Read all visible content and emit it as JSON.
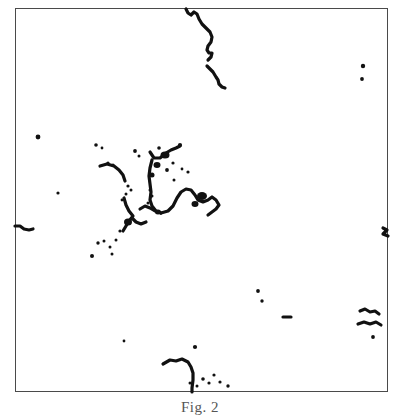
{
  "figure": {
    "caption": "Fig. 2",
    "frame": {
      "x": 15,
      "y": 8,
      "width": 373,
      "height": 384,
      "border_color": "#4a4a4a",
      "border_width": 1.4
    },
    "background_color": "#ffffff",
    "ink_color": "#111111"
  },
  "chart_data": {
    "type": "scatter",
    "title": "Fig. 2",
    "subtitle": "",
    "xlabel": "",
    "ylabel": "",
    "xlim": [
      0,
      400
    ],
    "ylim": [
      0,
      415
    ],
    "grid": false,
    "legend": null,
    "axis_ticks": {
      "x": [],
      "y": []
    },
    "series": [
      {
        "name": "isolated-dots",
        "marker": "dot",
        "points": [
          {
            "x": 38,
            "y": 137,
            "r": 2.4
          },
          {
            "x": 58,
            "y": 193,
            "r": 1.6
          },
          {
            "x": 96,
            "y": 145,
            "r": 1.8
          },
          {
            "x": 102,
            "y": 148,
            "r": 1.4
          },
          {
            "x": 108,
            "y": 163,
            "r": 1.6
          },
          {
            "x": 113,
            "y": 165,
            "r": 1.5
          },
          {
            "x": 135,
            "y": 151,
            "r": 1.9
          },
          {
            "x": 139,
            "y": 156,
            "r": 1.5
          },
          {
            "x": 159,
            "y": 148,
            "r": 1.8
          },
          {
            "x": 167,
            "y": 170,
            "r": 1.9
          },
          {
            "x": 173,
            "y": 163,
            "r": 1.6
          },
          {
            "x": 174,
            "y": 180,
            "r": 1.5
          },
          {
            "x": 180,
            "y": 145,
            "r": 2.1
          },
          {
            "x": 188,
            "y": 172,
            "r": 1.6
          },
          {
            "x": 182,
            "y": 169,
            "r": 1.4
          },
          {
            "x": 128,
            "y": 186,
            "r": 1.6
          },
          {
            "x": 131,
            "y": 190,
            "r": 1.5
          },
          {
            "x": 126,
            "y": 194,
            "r": 1.5
          },
          {
            "x": 150,
            "y": 190,
            "r": 1.5
          },
          {
            "x": 152,
            "y": 196,
            "r": 1.5
          },
          {
            "x": 148,
            "y": 203,
            "r": 1.5
          },
          {
            "x": 122,
            "y": 200,
            "r": 1.4
          },
          {
            "x": 98,
            "y": 243,
            "r": 1.7
          },
          {
            "x": 104,
            "y": 241,
            "r": 1.5
          },
          {
            "x": 110,
            "y": 247,
            "r": 1.5
          },
          {
            "x": 116,
            "y": 240,
            "r": 1.5
          },
          {
            "x": 112,
            "y": 254,
            "r": 1.5
          },
          {
            "x": 92,
            "y": 256,
            "r": 2.0
          },
          {
            "x": 120,
            "y": 231,
            "r": 1.6
          },
          {
            "x": 258,
            "y": 291,
            "r": 1.9
          },
          {
            "x": 262,
            "y": 301,
            "r": 1.7
          },
          {
            "x": 363,
            "y": 66,
            "r": 2.2
          },
          {
            "x": 362,
            "y": 79,
            "r": 1.9
          },
          {
            "x": 373,
            "y": 337,
            "r": 1.9
          },
          {
            "x": 124,
            "y": 341,
            "r": 1.4
          },
          {
            "x": 195,
            "y": 347,
            "r": 2.1
          },
          {
            "x": 203,
            "y": 379,
            "r": 1.8
          },
          {
            "x": 209,
            "y": 383,
            "r": 1.6
          },
          {
            "x": 214,
            "y": 375,
            "r": 1.6
          },
          {
            "x": 220,
            "y": 382,
            "r": 1.6
          },
          {
            "x": 228,
            "y": 386,
            "r": 1.7
          },
          {
            "x": 197,
            "y": 386,
            "r": 1.5
          },
          {
            "x": 190,
            "y": 383,
            "r": 1.5
          }
        ]
      },
      {
        "name": "heavy-blobs",
        "marker": "blob",
        "points": [
          {
            "x": 165,
            "y": 155,
            "w": 9,
            "h": 7
          },
          {
            "x": 157,
            "y": 165,
            "w": 7,
            "h": 6
          },
          {
            "x": 152,
            "y": 175,
            "w": 5,
            "h": 5
          },
          {
            "x": 202,
            "y": 196,
            "w": 10,
            "h": 8
          },
          {
            "x": 195,
            "y": 204,
            "w": 7,
            "h": 6
          },
          {
            "x": 128,
            "y": 222,
            "w": 8,
            "h": 7
          },
          {
            "x": 158,
            "y": 212,
            "w": 6,
            "h": 5
          }
        ]
      }
    ],
    "polylines": [
      {
        "name": "top-wavy-strand",
        "points": [
          [
            186,
            9
          ],
          [
            188,
            13
          ],
          [
            191,
            15
          ],
          [
            194,
            12
          ],
          [
            197,
            14
          ],
          [
            199,
            19
          ],
          [
            202,
            24
          ],
          [
            206,
            28
          ],
          [
            210,
            32
          ],
          [
            212,
            37
          ],
          [
            211,
            42
          ],
          [
            208,
            46
          ],
          [
            207,
            50
          ],
          [
            209,
            53
          ],
          [
            212,
            53
          ],
          [
            211,
            57
          ],
          [
            208,
            60
          ]
        ]
      },
      {
        "name": "top-wavy-strand-lower",
        "points": [
          [
            207,
            66
          ],
          [
            210,
            69
          ],
          [
            213,
            72
          ],
          [
            216,
            77
          ],
          [
            218,
            80
          ],
          [
            219,
            84
          ],
          [
            222,
            87
          ],
          [
            225,
            88
          ]
        ]
      },
      {
        "name": "central-arc-left",
        "points": [
          [
            100,
            166
          ],
          [
            107,
            164
          ],
          [
            114,
            166
          ],
          [
            119,
            170
          ],
          [
            123,
            175
          ],
          [
            125,
            181
          ]
        ]
      },
      {
        "name": "central-arc-lower-left",
        "points": [
          [
            124,
            198
          ],
          [
            126,
            205
          ],
          [
            129,
            211
          ],
          [
            133,
            216
          ],
          [
            129,
            221
          ],
          [
            126,
            226
          ],
          [
            123,
            231
          ]
        ]
      },
      {
        "name": "central-spine",
        "points": [
          [
            150,
            152
          ],
          [
            154,
            158
          ],
          [
            160,
            158
          ],
          [
            166,
            153
          ],
          [
            171,
            150
          ],
          [
            176,
            148
          ],
          [
            180,
            146
          ]
        ]
      },
      {
        "name": "central-vertical",
        "points": [
          [
            152,
            160
          ],
          [
            150,
            168
          ],
          [
            149,
            176
          ],
          [
            150,
            184
          ],
          [
            151,
            192
          ],
          [
            150,
            200
          ],
          [
            152,
            206
          ],
          [
            156,
            211
          ],
          [
            161,
            213
          ]
        ]
      },
      {
        "name": "central-arch-right",
        "points": [
          [
            161,
            213
          ],
          [
            168,
            211
          ],
          [
            173,
            206
          ],
          [
            177,
            198
          ],
          [
            181,
            192
          ],
          [
            186,
            189
          ],
          [
            191,
            190
          ],
          [
            195,
            195
          ],
          [
            198,
            200
          ],
          [
            203,
            202
          ],
          [
            208,
            200
          ],
          [
            212,
            197
          ],
          [
            216,
            200
          ],
          [
            219,
            205
          ],
          [
            216,
            209
          ],
          [
            212,
            212
          ],
          [
            208,
            215
          ]
        ]
      },
      {
        "name": "central-hook-mid",
        "points": [
          [
            140,
            209
          ],
          [
            145,
            206
          ],
          [
            150,
            208
          ],
          [
            155,
            211
          ]
        ]
      },
      {
        "name": "central-hook-low",
        "points": [
          [
            132,
            218
          ],
          [
            136,
            222
          ],
          [
            141,
            224
          ],
          [
            146,
            222
          ]
        ]
      },
      {
        "name": "left-border-hook",
        "points": [
          [
            15,
            226
          ],
          [
            20,
            226
          ],
          [
            24,
            229
          ],
          [
            29,
            230
          ],
          [
            33,
            229
          ]
        ]
      },
      {
        "name": "right-border-mark",
        "points": [
          [
            383,
            228
          ],
          [
            387,
            230
          ],
          [
            383,
            234
          ],
          [
            388,
            236
          ]
        ]
      },
      {
        "name": "lower-right-squiggle",
        "points": [
          [
            360,
            311
          ],
          [
            365,
            309
          ],
          [
            370,
            312
          ],
          [
            375,
            311
          ],
          [
            379,
            314
          ]
        ]
      },
      {
        "name": "lower-right-squiggle-2",
        "points": [
          [
            358,
            324
          ],
          [
            364,
            322
          ],
          [
            370,
            324
          ],
          [
            376,
            322
          ],
          [
            381,
            325
          ]
        ]
      },
      {
        "name": "mid-right-dash",
        "points": [
          [
            283,
            317
          ],
          [
            291,
            317
          ]
        ]
      },
      {
        "name": "bottom-curve",
        "points": [
          [
            163,
            364
          ],
          [
            170,
            360
          ],
          [
            176,
            361
          ],
          [
            182,
            359
          ],
          [
            188,
            362
          ],
          [
            191,
            367
          ],
          [
            193,
            373
          ],
          [
            193,
            380
          ],
          [
            192,
            388
          ],
          [
            192,
            392
          ]
        ]
      }
    ]
  }
}
